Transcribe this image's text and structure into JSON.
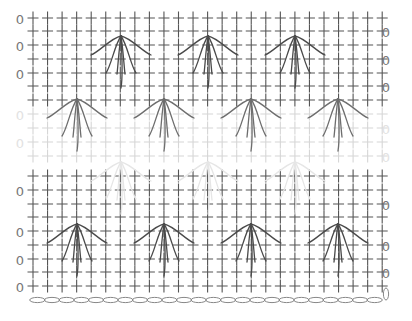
{
  "diagram": {
    "colors": {
      "background": "#ffffff",
      "dark_stitch": "#555555",
      "faded_stitch": "#d6d6d6",
      "ghost_stitch": "#ebebeb",
      "chain": "#888888"
    },
    "grid": {
      "columns": 25,
      "x_start": 33,
      "x_step": 14.55,
      "cross_size": 5.5
    },
    "rows": [
      {
        "y": 18,
        "tone": "dark",
        "turn_side": "left"
      },
      {
        "y": 31,
        "tone": "dark",
        "turn_side": "right"
      },
      {
        "y": 45,
        "tone": "dark",
        "turn_side": "left"
      },
      {
        "y": 59,
        "tone": "dark",
        "turn_side": "right"
      },
      {
        "y": 73,
        "tone": "dark",
        "turn_side": "left"
      },
      {
        "y": 86,
        "tone": "dark",
        "turn_side": "right"
      },
      {
        "y": 100,
        "tone": "dark",
        "turn_side": "none"
      },
      {
        "y": 114,
        "tone": "faded",
        "turn_side": "left"
      },
      {
        "y": 128,
        "tone": "faded",
        "turn_side": "right"
      },
      {
        "y": 142,
        "tone": "faded",
        "turn_side": "left"
      },
      {
        "y": 156,
        "tone": "faded",
        "turn_side": "right"
      },
      {
        "y": 176,
        "tone": "dark",
        "turn_side": "none"
      },
      {
        "y": 190,
        "tone": "dark",
        "turn_side": "left"
      },
      {
        "y": 204,
        "tone": "dark",
        "turn_side": "right"
      },
      {
        "y": 217,
        "tone": "dark",
        "turn_side": "none"
      },
      {
        "y": 231,
        "tone": "dark",
        "turn_side": "left"
      },
      {
        "y": 245,
        "tone": "dark",
        "turn_side": "right"
      },
      {
        "y": 259,
        "tone": "dark",
        "turn_side": "left"
      },
      {
        "y": 272,
        "tone": "dark",
        "turn_side": "right"
      },
      {
        "y": 286,
        "tone": "dark",
        "turn_side": "left"
      }
    ],
    "turning_chain": {
      "symbol": "0",
      "left_x": 20,
      "right_x": 386
    },
    "fans": [
      {
        "cx": 121,
        "apex_y": 36,
        "tone": "dark"
      },
      {
        "cx": 208,
        "apex_y": 36,
        "tone": "dark"
      },
      {
        "cx": 295,
        "apex_y": 36,
        "tone": "dark"
      },
      {
        "cx": 77,
        "apex_y": 99,
        "tone": "mid"
      },
      {
        "cx": 164,
        "apex_y": 99,
        "tone": "mid"
      },
      {
        "cx": 251,
        "apex_y": 99,
        "tone": "mid"
      },
      {
        "cx": 338,
        "apex_y": 99,
        "tone": "mid"
      },
      {
        "cx": 121,
        "apex_y": 162,
        "tone": "ghost"
      },
      {
        "cx": 208,
        "apex_y": 162,
        "tone": "ghost"
      },
      {
        "cx": 295,
        "apex_y": 162,
        "tone": "ghost"
      },
      {
        "cx": 77,
        "apex_y": 224,
        "tone": "dark"
      },
      {
        "cx": 164,
        "apex_y": 224,
        "tone": "dark"
      },
      {
        "cx": 251,
        "apex_y": 224,
        "tone": "dark"
      },
      {
        "cx": 338,
        "apex_y": 224,
        "tone": "dark"
      }
    ],
    "foundation_chain": {
      "y": 300,
      "x_start": 30,
      "x_end": 382,
      "count": 24,
      "end_loop_x": 386
    },
    "legend": {
      "cross": "single crochet (sc)",
      "zero": "chain stitch (turning chain)",
      "oval": "foundation chain (ch)",
      "fan": "long-stitch cluster worked into lower rows"
    }
  }
}
